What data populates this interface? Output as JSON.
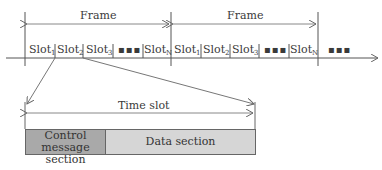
{
  "diagram": {
    "frames": [
      {
        "label": "Frame",
        "slots": [
          "Slot",
          "Slot",
          "Slot",
          "Slot"
        ],
        "subscripts": [
          "1",
          "2",
          "3",
          "N"
        ],
        "ellipsis": "▪▪▪"
      },
      {
        "label": "Frame",
        "slots": [
          "Slot",
          "Slot",
          "Slot",
          "Slot"
        ],
        "subscripts": [
          "1",
          "2",
          "3",
          "N"
        ],
        "ellipsis": "▪▪▪"
      }
    ],
    "trailing_ellipsis": "▪▪▪",
    "time_slot": {
      "label": "Time slot",
      "control_section": "Control message section",
      "control_line1": "Control message",
      "control_line2": "section",
      "data_section": "Data section"
    },
    "colors": {
      "line": "#555555",
      "control_fill": "#a9a9a9",
      "data_fill": "#d6d6d6"
    }
  }
}
